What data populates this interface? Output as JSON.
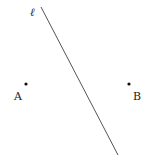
{
  "diagram": {
    "line": {
      "label": "ℓ",
      "x1": 41,
      "y1": 7,
      "x2": 118,
      "y2": 155,
      "color": "#555555"
    },
    "points": [
      {
        "label": "A",
        "x": 26,
        "y": 84,
        "label_x": 14,
        "label_y": 100
      },
      {
        "label": "B",
        "x": 129,
        "y": 84,
        "label_x": 133,
        "label_y": 100
      }
    ],
    "line_label_pos": {
      "x": 30,
      "y": 16
    }
  }
}
